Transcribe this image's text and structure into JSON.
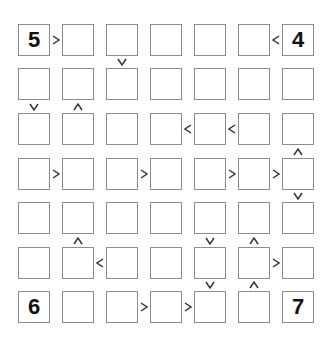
{
  "puzzle": {
    "type": "futoshiki",
    "size": 7,
    "grid": [
      [
        "5",
        "",
        "",
        "",
        "",
        "",
        "4"
      ],
      [
        "",
        "",
        "",
        "",
        "",
        "",
        ""
      ],
      [
        "",
        "",
        "",
        "",
        "",
        "",
        ""
      ],
      [
        "",
        "",
        "",
        "",
        "",
        "",
        ""
      ],
      [
        "",
        "",
        "",
        "",
        "",
        "",
        ""
      ],
      [
        "",
        "",
        "",
        "",
        "",
        "",
        ""
      ],
      [
        "6",
        "",
        "",
        "",
        "",
        "",
        "7"
      ]
    ],
    "horizontal_constraints": [
      {
        "row": 0,
        "col": 0,
        "sign": ">"
      },
      {
        "row": 0,
        "col": 5,
        "sign": "<"
      },
      {
        "row": 2,
        "col": 3,
        "sign": "<"
      },
      {
        "row": 2,
        "col": 4,
        "sign": "<"
      },
      {
        "row": 3,
        "col": 0,
        "sign": ">"
      },
      {
        "row": 3,
        "col": 2,
        "sign": ">"
      },
      {
        "row": 3,
        "col": 4,
        "sign": ">"
      },
      {
        "row": 3,
        "col": 5,
        "sign": ">"
      },
      {
        "row": 5,
        "col": 1,
        "sign": "<"
      },
      {
        "row": 5,
        "col": 5,
        "sign": ">"
      },
      {
        "row": 6,
        "col": 2,
        "sign": ">"
      },
      {
        "row": 6,
        "col": 3,
        "sign": ">"
      }
    ],
    "vertical_constraints": [
      {
        "row": 0,
        "col": 2,
        "sign": "v"
      },
      {
        "row": 1,
        "col": 0,
        "sign": "v"
      },
      {
        "row": 1,
        "col": 1,
        "sign": "^"
      },
      {
        "row": 2,
        "col": 6,
        "sign": "^"
      },
      {
        "row": 3,
        "col": 6,
        "sign": "v"
      },
      {
        "row": 4,
        "col": 1,
        "sign": "^"
      },
      {
        "row": 4,
        "col": 4,
        "sign": "v"
      },
      {
        "row": 4,
        "col": 5,
        "sign": "^"
      },
      {
        "row": 5,
        "col": 4,
        "sign": "v"
      },
      {
        "row": 5,
        "col": 5,
        "sign": "^"
      }
    ]
  },
  "colors": {
    "cell_border": "#8c8c8c",
    "sign": "#333333",
    "digit": "#111111",
    "background": "#ffffff"
  }
}
